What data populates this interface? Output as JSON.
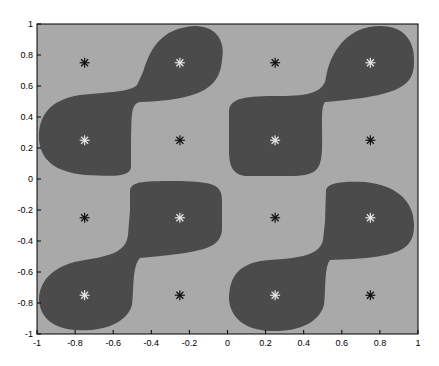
{
  "chart_data": {
    "type": "heatmap",
    "title": "",
    "xlabel": "",
    "ylabel": "",
    "xlim": [
      -1,
      1
    ],
    "ylim": [
      -1,
      1
    ],
    "grid": false,
    "legend": null,
    "x_ticks": [
      "-1",
      "-0.8",
      "-0.6",
      "-0.4",
      "-0.2",
      "0",
      "0.2",
      "0.4",
      "0.6",
      "0.8",
      "1"
    ],
    "y_ticks": [
      "1",
      "0.8",
      "0.6",
      "0.4",
      "0.2",
      "0",
      "-0.2",
      "-0.4",
      "-0.6",
      "-0.8",
      "-1"
    ],
    "regions": {
      "background_class_color": "#a9a9a9",
      "foreground_class_color": "#4b4b4b",
      "description": "Two-class decision regions; four S-shaped dark blobs, one per quadrant, each connecting two diagonal cluster centers."
    },
    "markers": {
      "symbol": "*",
      "light_on_dark": [
        {
          "x": -0.25,
          "y": 0.75
        },
        {
          "x": -0.75,
          "y": 0.25
        },
        {
          "x": 0.75,
          "y": 0.75
        },
        {
          "x": 0.25,
          "y": 0.25
        },
        {
          "x": -0.25,
          "y": -0.25
        },
        {
          "x": -0.75,
          "y": -0.75
        },
        {
          "x": 0.75,
          "y": -0.25
        },
        {
          "x": 0.25,
          "y": -0.75
        }
      ],
      "dark_on_light": [
        {
          "x": -0.75,
          "y": 0.75
        },
        {
          "x": -0.25,
          "y": 0.25
        },
        {
          "x": 0.25,
          "y": 0.75
        },
        {
          "x": 0.75,
          "y": 0.25
        },
        {
          "x": -0.75,
          "y": -0.25
        },
        {
          "x": -0.25,
          "y": -0.75
        },
        {
          "x": 0.25,
          "y": -0.25
        },
        {
          "x": 0.75,
          "y": -0.75
        }
      ]
    }
  }
}
